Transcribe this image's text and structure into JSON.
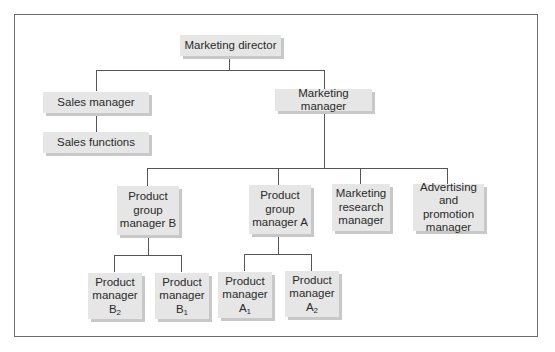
{
  "diagram": {
    "type": "org-chart",
    "nodes": {
      "marketing_director": "Marketing director",
      "sales_manager": "Sales manager",
      "sales_functions": "Sales functions",
      "marketing_manager": "Marketing manager",
      "pgm_b": [
        "Product",
        "group",
        "manager B"
      ],
      "pgm_a": [
        "Product",
        "group",
        "manager A"
      ],
      "mrm": [
        "Marketing",
        "research",
        "manager"
      ],
      "apm": [
        "Advertising",
        "and promotion",
        "manager"
      ],
      "pm_b2": {
        "l1": "Product",
        "l2": "manager",
        "letter": "B",
        "sub": "2"
      },
      "pm_b1": {
        "l1": "Product",
        "l2": "manager",
        "letter": "B",
        "sub": "1"
      },
      "pm_a1": {
        "l1": "Product",
        "l2": "manager",
        "letter": "A",
        "sub": "1"
      },
      "pm_a2": {
        "l1": "Product",
        "l2": "manager",
        "letter": "A",
        "sub": "2"
      }
    },
    "edges": [
      [
        "Marketing director",
        "Sales manager"
      ],
      [
        "Marketing director",
        "Marketing manager"
      ],
      [
        "Sales manager",
        "Sales functions"
      ],
      [
        "Marketing manager",
        "Product group manager B"
      ],
      [
        "Marketing manager",
        "Product group manager A"
      ],
      [
        "Marketing manager",
        "Marketing research manager"
      ],
      [
        "Marketing manager",
        "Advertising and promotion manager"
      ],
      [
        "Product group manager B",
        "Product manager B2"
      ],
      [
        "Product group manager B",
        "Product manager B1"
      ],
      [
        "Product group manager A",
        "Product manager A1"
      ],
      [
        "Product group manager A",
        "Product manager A2"
      ]
    ],
    "colors": {
      "box": "#e6e6e6",
      "shadow": "#c8c8c8",
      "line": "#555555",
      "frame": "#6b6b6b"
    }
  }
}
